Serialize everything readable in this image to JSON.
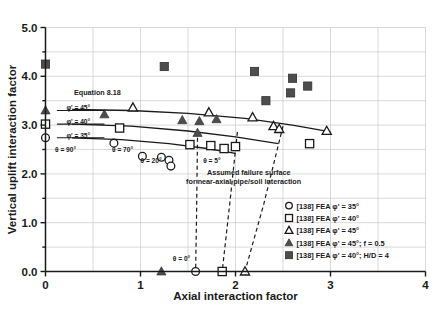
{
  "chart_data": {
    "type": "scatter",
    "title": "",
    "xlabel": "Axial interaction factor",
    "ylabel": "Vertical uplift interaction factor",
    "xlim": [
      0,
      4
    ],
    "ylim": [
      0,
      5
    ],
    "xticks": [
      "0",
      "1",
      "2",
      "3",
      "4"
    ],
    "xtick_values": [
      0,
      1,
      2,
      3,
      4
    ],
    "yticks": [
      "0.0",
      "1.0",
      "2.0",
      "3.0",
      "4.0",
      "5.0"
    ],
    "ytick_values": [
      0,
      1,
      2,
      3,
      4,
      5
    ],
    "grid": "major gridlines every 0.5 on both axes",
    "legend_position": "lower right inside plot",
    "series": [
      {
        "name": "[138] FEA  φ' = 35°",
        "marker": "open-circle",
        "points": [
          [
            0.0,
            2.74
          ],
          [
            0.72,
            2.63
          ],
          [
            1.02,
            2.36
          ],
          [
            1.22,
            2.34
          ],
          [
            1.3,
            2.28
          ],
          [
            1.32,
            2.16
          ],
          [
            1.58,
            0.0
          ]
        ]
      },
      {
        "name": "[138] FEA  φ' = 40°",
        "marker": "open-square",
        "points": [
          [
            0.0,
            3.02
          ],
          [
            0.78,
            2.94
          ],
          [
            1.52,
            2.6
          ],
          [
            1.74,
            2.58
          ],
          [
            1.88,
            2.52
          ],
          [
            2.0,
            2.56
          ],
          [
            2.78,
            2.62
          ],
          [
            1.86,
            0.0
          ]
        ]
      },
      {
        "name": "[138] FEA  φ' = 45°",
        "marker": "open-triangle",
        "points": [
          [
            0.92,
            3.36
          ],
          [
            1.72,
            3.26
          ],
          [
            2.18,
            3.16
          ],
          [
            2.4,
            2.98
          ],
          [
            2.46,
            2.92
          ],
          [
            2.96,
            2.88
          ],
          [
            2.1,
            0.0
          ]
        ]
      },
      {
        "name": "[138] FEA  φ' = 45°; f = 0.5",
        "marker": "filled-triangle",
        "points": [
          [
            0.0,
            3.3
          ],
          [
            0.62,
            3.22
          ],
          [
            1.44,
            3.1
          ],
          [
            1.62,
            3.08
          ],
          [
            1.8,
            3.12
          ],
          [
            1.6,
            2.84
          ],
          [
            1.22,
            0.0
          ]
        ]
      },
      {
        "name": "[138] FEA  φ' = 40°; H/D = 4",
        "marker": "filled-square",
        "points": [
          [
            0.0,
            4.25
          ],
          [
            1.25,
            4.2
          ],
          [
            2.2,
            4.1
          ],
          [
            2.6,
            3.96
          ],
          [
            2.76,
            3.8
          ],
          [
            2.58,
            3.66
          ],
          [
            2.32,
            3.5
          ]
        ]
      }
    ],
    "curves": [
      {
        "name": "Equation 8.18, phi' = 45",
        "style": "solid",
        "points": [
          [
            0.28,
            3.32
          ],
          [
            0.9,
            3.3
          ],
          [
            1.5,
            3.24
          ],
          [
            2.1,
            3.14
          ],
          [
            2.6,
            3.0
          ],
          [
            3.0,
            2.86
          ]
        ]
      },
      {
        "name": "Equation 8.18, phi' = 40",
        "style": "solid",
        "points": [
          [
            0.28,
            3.02
          ],
          [
            0.9,
            2.98
          ],
          [
            1.5,
            2.88
          ],
          [
            2.0,
            2.76
          ],
          [
            2.45,
            2.62
          ]
        ]
      },
      {
        "name": "Equation 8.18, phi' = 35",
        "style": "solid",
        "points": [
          [
            0.28,
            2.74
          ],
          [
            0.8,
            2.7
          ],
          [
            1.3,
            2.62
          ],
          [
            1.7,
            2.52
          ],
          [
            2.0,
            2.42
          ]
        ]
      },
      {
        "name": "Assumed failure surface, theta = 5",
        "style": "dashed",
        "points": [
          [
            1.6,
            2.74
          ],
          [
            1.59,
            1.2
          ],
          [
            1.58,
            0.0
          ]
        ]
      },
      {
        "name": "Assumed failure surface, mid",
        "style": "dashed",
        "points": [
          [
            2.02,
            2.86
          ],
          [
            1.94,
            1.4
          ],
          [
            1.86,
            0.0
          ]
        ]
      },
      {
        "name": "Assumed failure surface, right",
        "style": "dashed",
        "points": [
          [
            2.5,
            2.98
          ],
          [
            2.3,
            1.4
          ],
          [
            2.1,
            0.0
          ]
        ]
      }
    ],
    "annotations": [
      {
        "text": "Equation 8.18",
        "x": 0.3,
        "y": 3.62
      },
      {
        "text": "φ' = 45°",
        "x": 0.22,
        "y": 3.3
      },
      {
        "text": "φ' = 40°",
        "x": 0.22,
        "y": 3.02
      },
      {
        "text": "φ' = 35°",
        "x": 0.22,
        "y": 2.74
      },
      {
        "text": "θ = 90°",
        "x": 0.1,
        "y": 2.44
      },
      {
        "text": "θ = 70°",
        "x": 0.7,
        "y": 2.44
      },
      {
        "text": "θ = 20°",
        "x": 1.0,
        "y": 2.22
      },
      {
        "text": "θ = 5°",
        "x": 1.66,
        "y": 2.22
      },
      {
        "text": "θ = 0°",
        "x": 1.34,
        "y": 0.22
      },
      {
        "text": "Assumed failure surface",
        "x": 1.7,
        "y": 1.98
      },
      {
        "text": "for near-axial pipe/soil interaction",
        "x": 1.48,
        "y": 1.8
      }
    ]
  },
  "legend": {
    "items": [
      {
        "marker": "open-circle",
        "label": "[138] FEA  φ' = 35°"
      },
      {
        "marker": "open-square",
        "label": "[138] FEA  φ' = 40°"
      },
      {
        "marker": "open-triangle",
        "label": "[138] FEA  φ' = 45°"
      },
      {
        "marker": "filled-triangle",
        "label": "[138] FEA  φ' = 45°; f = 0.5"
      },
      {
        "marker": "filled-square",
        "label": "[138] FEA  φ' = 40°; H/D = 4"
      }
    ]
  },
  "colors": {
    "marker_fill": "#4d4d4d",
    "axis": "#1a1a1a",
    "grid": "#c8c8c8",
    "background": "#ffffff"
  }
}
